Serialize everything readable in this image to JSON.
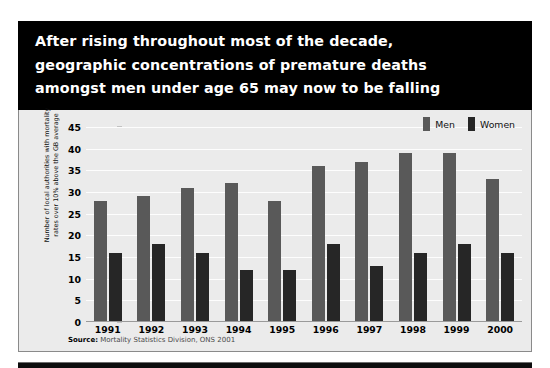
{
  "title": {
    "lines": [
      "After rising throughout most of the decade,",
      "geographic concentrations of premature deaths",
      "amongst men under age 65 may now to be falling"
    ]
  },
  "legend": {
    "items": [
      {
        "label": "Men",
        "color": "#595959"
      },
      {
        "label": "Women",
        "color": "#262626"
      }
    ]
  },
  "source": {
    "prefix": "Source:",
    "text": "Mortality Statistics Division, ONS 2001"
  },
  "axis": {
    "y_title_line1": "Number of local authorities with mortality",
    "y_title_line2": "rates over 10% above the GB average",
    "y_ticks": [
      "0",
      "5",
      "10",
      "15",
      "20",
      "25",
      "30",
      "35",
      "40",
      "45"
    ]
  },
  "colors": {
    "banner_background": "#000000",
    "banner_text": "#ffffff",
    "panel_background": "#ebebeb",
    "gridline": "#fdfdfd",
    "men": "#595959",
    "women": "#262626"
  },
  "chart_data": {
    "type": "bar",
    "title": "After rising throughout most of the decade, geographic concentrations of premature deaths amongst men under age 65 may now to be falling",
    "categories": [
      "1991",
      "1992",
      "1993",
      "1994",
      "1995",
      "1996",
      "1997",
      "1998",
      "1999",
      "2000"
    ],
    "series": [
      {
        "name": "Men",
        "color": "#595959",
        "values": [
          28,
          29,
          31,
          32,
          28,
          36,
          37,
          39,
          39,
          33
        ]
      },
      {
        "name": "Women",
        "color": "#262626",
        "values": [
          16,
          18,
          16,
          12,
          12,
          18,
          13,
          16,
          18,
          16
        ]
      }
    ],
    "xlabel": "",
    "ylabel": "Number of local authorities with mortality rates over 10% above the GB average",
    "ylim": [
      0,
      45
    ],
    "ytick_step": 5,
    "grid": true,
    "legend_position": "top-right",
    "source": "Source: Mortality Statistics Division, ONS 2001"
  }
}
